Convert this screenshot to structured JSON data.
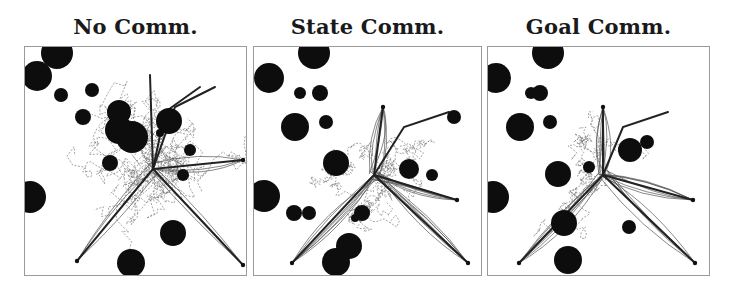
{
  "figure": {
    "panels": [
      {
        "title": "No Comm.",
        "left": 24,
        "width": 223,
        "obstacles": [
          [
            32,
            6,
            16
          ],
          [
            12,
            29,
            15
          ],
          [
            36,
            48,
            7
          ],
          [
            58,
            70,
            8
          ],
          [
            67,
            43,
            7
          ],
          [
            94,
            65,
            12
          ],
          [
            94,
            83,
            14
          ],
          [
            85,
            116,
            8
          ],
          [
            107,
            90,
            16
          ],
          [
            144,
            74,
            13
          ],
          [
            135,
            86,
            4
          ],
          [
            158,
            128,
            6
          ],
          [
            165,
            103,
            6
          ],
          [
            148,
            186,
            13
          ],
          [
            5,
            150,
            16
          ],
          [
            106,
            216,
            14
          ]
        ],
        "start_points": [
          [
            52,
            214
          ],
          [
            218,
            218
          ],
          [
            218,
            113
          ]
        ],
        "hub": [
          128,
          122
        ],
        "solid_paths": [
          "M128,122 L52,214",
          "M128,122 L218,218",
          "M128,122 L218,113",
          "M128,122 L125,28",
          "M128,122 L140,65 L175,40",
          "M128,122 L150,60 L190,40"
        ]
      },
      {
        "title": "State Comm.",
        "left": 253,
        "width": 229,
        "obstacles": [
          [
            60,
            6,
            16
          ],
          [
            15,
            31,
            15
          ],
          [
            46,
            46,
            6
          ],
          [
            72,
            75,
            7
          ],
          [
            66,
            46,
            8
          ],
          [
            41,
            80,
            14
          ],
          [
            82,
            116,
            13
          ],
          [
            10,
            149,
            16
          ],
          [
            108,
            166,
            8
          ],
          [
            101,
            171,
            4
          ],
          [
            40,
            166,
            8
          ],
          [
            55,
            166,
            7
          ],
          [
            95,
            199,
            13
          ],
          [
            82,
            215,
            14
          ],
          [
            178,
            128,
            6
          ],
          [
            200,
            70,
            7
          ],
          [
            155,
            122,
            10
          ]
        ],
        "start_points": [
          [
            38,
            216
          ],
          [
            214,
            216
          ],
          [
            203,
            153
          ],
          [
            129,
            60
          ]
        ],
        "hub": [
          120,
          128
        ],
        "solid_paths": [
          "M120,128 L38,216",
          "M120,128 L214,216",
          "M120,128 L203,153",
          "M120,128 L129,60",
          "M120,128 L150,80 L195,65"
        ]
      },
      {
        "title": "Goal Comm.",
        "left": 487,
        "width": 223,
        "obstacles": [
          [
            60,
            6,
            16
          ],
          [
            8,
            31,
            15
          ],
          [
            43,
            46,
            6
          ],
          [
            62,
            75,
            7
          ],
          [
            52,
            46,
            8
          ],
          [
            32,
            80,
            14
          ],
          [
            70,
            127,
            13
          ],
          [
            5,
            150,
            16
          ],
          [
            101,
            120,
            6
          ],
          [
            76,
            176,
            13
          ],
          [
            80,
            213,
            14
          ],
          [
            142,
            103,
            12
          ],
          [
            159,
            95,
            7
          ],
          [
            141,
            180,
            7
          ]
        ],
        "start_points": [
          [
            31,
            216
          ],
          [
            207,
            216
          ],
          [
            205,
            153
          ],
          [
            115,
            60
          ]
        ],
        "hub": [
          115,
          128
        ],
        "solid_paths": [
          "M115,128 L31,216",
          "M115,128 L207,216",
          "M115,128 L205,153",
          "M115,128 L115,60",
          "M115,128 L135,80 L180,65"
        ]
      }
    ]
  }
}
